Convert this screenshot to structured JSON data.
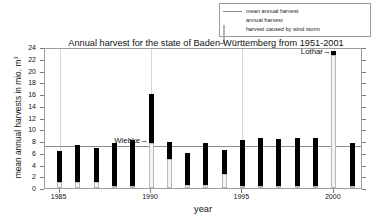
{
  "chart_data": {
    "type": "bar",
    "title": "Annual harvest for the state of Baden-Württemberg from 1951-2001",
    "xlabel": "year",
    "ylabel": "mean annual harvests in mio. m",
    "ylabel_exponent": "3",
    "xlim": [
      1984.2,
      2001.6
    ],
    "ylim": [
      0,
      24
    ],
    "yticks": [
      0,
      2,
      4,
      6,
      8,
      10,
      12,
      14,
      16,
      18,
      20,
      22,
      24
    ],
    "xticks": [
      1985,
      1990,
      1995,
      2000
    ],
    "grid": "vertical gridlines at x ticks",
    "legend_position": "above plot, right",
    "mean_annual_harvest": 7.5,
    "categories": [
      1985,
      1986,
      1987,
      1988,
      1989,
      1990,
      1991,
      1992,
      1993,
      1994,
      1995,
      1996,
      1997,
      1998,
      1999,
      2000,
      2001
    ],
    "series": [
      {
        "name": "annual harvest",
        "values": [
          6.3,
          7.4,
          6.8,
          7.7,
          8.2,
          16.0,
          7.9,
          5.9,
          7.6,
          6.4,
          8.1,
          8.5,
          8.3,
          8.6,
          8.5,
          23.4,
          7.7
        ]
      },
      {
        "name": "harvest caused by wind storm",
        "values": [
          1.0,
          1.1,
          1.1,
          0.4,
          0.3,
          7.6,
          5.0,
          0.5,
          0.5,
          2.4,
          0.3,
          0.3,
          0.3,
          0.3,
          0.3,
          22.6,
          0.4
        ]
      }
    ],
    "annotations": [
      {
        "text": "Wiebke→",
        "year": 1990,
        "value": 8.1
      },
      {
        "text": "Lothar→",
        "year": 2000,
        "value": 23.4
      }
    ]
  },
  "legend": {
    "items": [
      {
        "label": "mean annual harvest",
        "key": "line",
        "color": "#8d8d8d"
      },
      {
        "label": "annual harvest",
        "key": "solid-black",
        "color": "#000000"
      },
      {
        "label": "harvest caused by wind storm",
        "key": "solid-grey",
        "color": "#f2f2f2"
      }
    ]
  }
}
